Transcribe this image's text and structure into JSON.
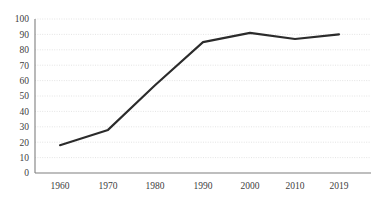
{
  "chart_data": {
    "type": "line",
    "title": "",
    "subtitle": "",
    "xlabel": "",
    "ylabel": "",
    "categories": [
      "1960",
      "1970",
      "1980",
      "1990",
      "2000",
      "2010",
      "2019"
    ],
    "x": [
      1960,
      1970,
      1980,
      1990,
      2000,
      2010,
      2019
    ],
    "values": [
      18,
      28,
      57,
      85,
      91,
      87,
      90
    ],
    "series": [
      {
        "name": "series-1",
        "values": [
          18,
          28,
          57,
          85,
          91,
          87,
          90
        ],
        "color": "#2b2b2b"
      }
    ],
    "ylim": [
      0,
      100
    ],
    "ytick_values": [
      0,
      10,
      20,
      30,
      40,
      50,
      60,
      70,
      80,
      90,
      100
    ],
    "ytick_labels": [
      "0",
      "10",
      "20",
      "30",
      "40",
      "50",
      "60",
      "70",
      "80",
      "90",
      "100"
    ],
    "xtick_labels": [
      "1960",
      "1970",
      "1980",
      "1990",
      "2000",
      "2010",
      "2019"
    ],
    "grid": true,
    "grid_axis": "y",
    "grid_color": "#d9d9d9",
    "legend": false,
    "legend_position": "none",
    "line_color": "#2b2b2b",
    "axis_color": "#7f7f7f",
    "background_color": "#ffffff",
    "markers": false,
    "annotations": []
  },
  "axes": {
    "y": {
      "labels": [
        "100",
        "90",
        "80",
        "70",
        "60",
        "50",
        "40",
        "30",
        "20",
        "10",
        "0"
      ]
    },
    "x": {
      "labels": [
        "1960",
        "1970",
        "1980",
        "1990",
        "2000",
        "2010",
        "2019"
      ]
    }
  }
}
